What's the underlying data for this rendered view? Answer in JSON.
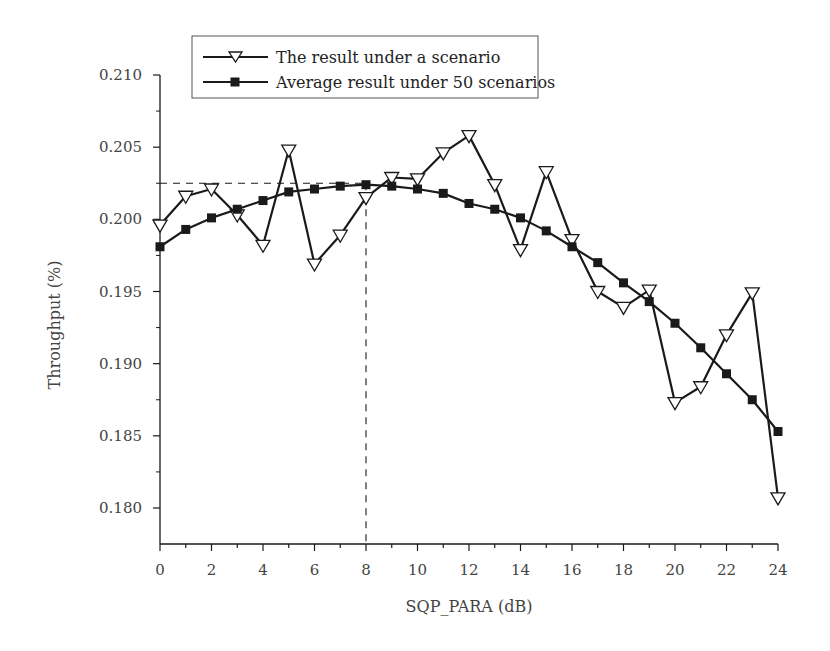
{
  "chart_data": {
    "type": "line",
    "title": "",
    "xlabel": "SQP_PARA (dB)",
    "ylabel": "Throughput (%)",
    "xlim": [
      0,
      24
    ],
    "ylim": [
      0.1775,
      0.21
    ],
    "xticks": [
      0,
      2,
      4,
      6,
      8,
      10,
      12,
      14,
      16,
      18,
      20,
      22,
      24
    ],
    "xtick_labels": [
      "0",
      "2",
      "4",
      "6",
      "8",
      "10",
      "12",
      "14",
      "16",
      "18",
      "20",
      "22",
      "24"
    ],
    "yticks": [
      0.18,
      0.185,
      0.19,
      0.195,
      0.2,
      0.205,
      0.21
    ],
    "ytick_labels": [
      "0.180",
      "0.185",
      "0.190",
      "0.195",
      "0.200",
      "0.205",
      "0.210"
    ],
    "grid": false,
    "legend_position": "top-left inside box",
    "x": [
      0,
      1,
      2,
      3,
      4,
      5,
      6,
      7,
      8,
      9,
      10,
      11,
      12,
      13,
      14,
      15,
      16,
      17,
      18,
      19,
      20,
      21,
      22,
      23,
      24
    ],
    "series": [
      {
        "name": "The result under a scenario",
        "marker": "open-down-triangle",
        "values": [
          0.1996,
          0.2016,
          0.2021,
          0.2003,
          0.1982,
          0.2048,
          0.1969,
          0.1989,
          0.2015,
          0.2029,
          0.2028,
          0.2046,
          0.2058,
          0.2024,
          0.1979,
          0.2033,
          0.1986,
          0.195,
          0.1939,
          0.1951,
          0.1873,
          0.1884,
          0.192,
          0.1949,
          0.1807
        ]
      },
      {
        "name": "Average result under 50 scenarios",
        "marker": "filled-square",
        "values": [
          0.1981,
          0.1993,
          0.2001,
          0.2007,
          0.2013,
          0.2019,
          0.2021,
          0.2023,
          0.2024,
          0.2023,
          0.2021,
          0.2018,
          0.2011,
          0.2007,
          0.2001,
          0.1992,
          0.1981,
          0.197,
          0.1956,
          0.1943,
          0.1928,
          0.1911,
          0.1893,
          0.1875,
          0.1853
        ]
      }
    ],
    "annotations": [
      {
        "type": "dashed-hline",
        "y": 0.2025,
        "x_from": 0,
        "x_to": 8
      },
      {
        "type": "dashed-vline",
        "x": 8,
        "y_from": 0.1775,
        "y_to": 0.2025
      }
    ]
  },
  "legend": {
    "items": [
      {
        "label": "The result under a scenario"
      },
      {
        "label": "Average result under 50 scenarios"
      }
    ]
  },
  "axes": {
    "xlabel": "SQP_PARA (dB)",
    "ylabel": "Throughput (%)"
  },
  "colors": {
    "line": "#1a1a1a",
    "text": "#444444",
    "background": "#ffffff"
  }
}
